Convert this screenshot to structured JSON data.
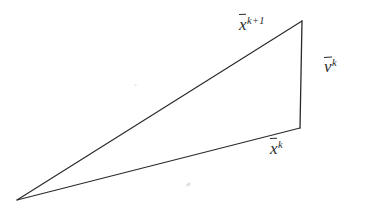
{
  "figure": {
    "kind": "line-diagram",
    "background_color": "#ffffff",
    "stroke_color": "#2a2a2a",
    "stroke_width": 1.1,
    "width": 374,
    "height": 203
  },
  "geometry": {
    "vertices": {
      "apex": {
        "label": "origin-apex",
        "x": 17,
        "y": 200
      },
      "top_right": {
        "label": "x-k-plus-1-endpoint",
        "x": 302,
        "y": 21
      },
      "bottom_right": {
        "label": "x-k-endpoint",
        "x": 300,
        "y": 128
      }
    },
    "edges": [
      {
        "name": "x-k-plus-1-edge",
        "from": "apex",
        "to": "top_right"
      },
      {
        "name": "v-k-edge",
        "from": "top_right",
        "to": "bottom_right"
      },
      {
        "name": "x-k-edge",
        "from": "bottom_right",
        "to": "apex"
      }
    ]
  },
  "labels": {
    "x_next": {
      "base": "x",
      "superscript": "k+1",
      "name": "x-k-plus-1-label"
    },
    "v_k": {
      "base": "v",
      "superscript": "k",
      "name": "v-k-label"
    },
    "x_k": {
      "base": "x",
      "superscript": "k",
      "name": "x-k-label"
    }
  }
}
